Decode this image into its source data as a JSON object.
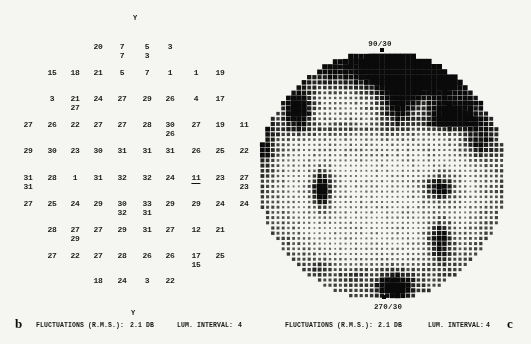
{
  "colors": {
    "paper": "#f5f5f1",
    "ink": "#1a1a1a",
    "dot": "#0a0a0a"
  },
  "panel_b": {
    "label": "b",
    "y_axis_top": "Y",
    "y_axis_bottom": "Y",
    "caption": {
      "fluctuations_label": "FLUCTUATIONS (R.M.S.):",
      "fluctuations_value": "2.1 DB",
      "lum_label": "LUM. INTERVAL:",
      "lum_value": "4"
    }
  },
  "panel_c": {
    "label": "c",
    "meridian_top": "90/30",
    "meridian_bottom": "270/30",
    "caption": {
      "fluctuations_label": "FLUCTUATIONS (R.M.S.):",
      "fluctuations_value": "2.1 DB",
      "lum_label": "LUM. INTERVAL:",
      "lum_value": "4"
    }
  },
  "chart_data": [
    {
      "type": "heatmap",
      "title": "Differential light sensitivity values grid (dB) - panel b",
      "value_unit": "dB",
      "layout": {
        "col_x": [
          28,
          52,
          75,
          98,
          122,
          147,
          170,
          196,
          220,
          244
        ],
        "row_y": [
          47,
          73,
          99,
          125,
          151,
          178,
          204,
          230,
          256,
          281
        ],
        "second_value_offset": 9
      },
      "points": [
        [
          0,
          3,
          "20",
          null,
          0
        ],
        [
          0,
          4,
          "7",
          "7",
          0
        ],
        [
          0,
          5,
          "5",
          "3",
          0
        ],
        [
          0,
          6,
          "3",
          null,
          0
        ],
        [
          1,
          1,
          "15",
          null,
          0
        ],
        [
          1,
          2,
          "18",
          null,
          0
        ],
        [
          1,
          3,
          "21",
          null,
          0
        ],
        [
          1,
          4,
          "5",
          null,
          0
        ],
        [
          1,
          5,
          "7",
          null,
          0
        ],
        [
          1,
          6,
          "1",
          null,
          0
        ],
        [
          1,
          7,
          "1",
          null,
          0
        ],
        [
          1,
          8,
          "19",
          null,
          0
        ],
        [
          2,
          1,
          "3",
          null,
          0
        ],
        [
          2,
          2,
          "21",
          "27",
          0
        ],
        [
          2,
          3,
          "24",
          null,
          0
        ],
        [
          2,
          4,
          "27",
          null,
          0
        ],
        [
          2,
          5,
          "29",
          null,
          0
        ],
        [
          2,
          6,
          "26",
          null,
          0
        ],
        [
          2,
          7,
          "4",
          null,
          0
        ],
        [
          2,
          8,
          "17",
          null,
          0
        ],
        [
          3,
          0,
          "27",
          null,
          0
        ],
        [
          3,
          1,
          "26",
          null,
          0
        ],
        [
          3,
          2,
          "22",
          null,
          0
        ],
        [
          3,
          3,
          "27",
          null,
          0
        ],
        [
          3,
          4,
          "27",
          null,
          0
        ],
        [
          3,
          5,
          "28",
          null,
          0
        ],
        [
          3,
          6,
          "30",
          "26",
          0
        ],
        [
          3,
          7,
          "27",
          null,
          0
        ],
        [
          3,
          8,
          "19",
          null,
          0
        ],
        [
          3,
          9,
          "11",
          null,
          0
        ],
        [
          4,
          0,
          "29",
          null,
          0
        ],
        [
          4,
          1,
          "30",
          null,
          0
        ],
        [
          4,
          2,
          "23",
          null,
          0
        ],
        [
          4,
          3,
          "30",
          null,
          0
        ],
        [
          4,
          4,
          "31",
          null,
          0
        ],
        [
          4,
          5,
          "31",
          null,
          0
        ],
        [
          4,
          6,
          "31",
          null,
          0
        ],
        [
          4,
          7,
          "26",
          null,
          0
        ],
        [
          4,
          8,
          "25",
          null,
          0
        ],
        [
          4,
          9,
          "22",
          null,
          0
        ],
        [
          5,
          0,
          "31",
          "31",
          0
        ],
        [
          5,
          1,
          "28",
          null,
          0
        ],
        [
          5,
          2,
          "1",
          null,
          0
        ],
        [
          5,
          3,
          "31",
          null,
          0
        ],
        [
          5,
          4,
          "32",
          null,
          0
        ],
        [
          5,
          5,
          "32",
          null,
          0
        ],
        [
          5,
          6,
          "24",
          null,
          0
        ],
        [
          5,
          7,
          "11",
          null,
          1
        ],
        [
          5,
          8,
          "23",
          null,
          0
        ],
        [
          5,
          9,
          "27",
          "23",
          0
        ],
        [
          6,
          0,
          "27",
          null,
          0
        ],
        [
          6,
          1,
          "25",
          null,
          0
        ],
        [
          6,
          2,
          "24",
          null,
          0
        ],
        [
          6,
          3,
          "29",
          null,
          0
        ],
        [
          6,
          4,
          "30",
          "32",
          0
        ],
        [
          6,
          5,
          "33",
          "31",
          0
        ],
        [
          6,
          6,
          "29",
          null,
          0
        ],
        [
          6,
          7,
          "29",
          null,
          0
        ],
        [
          6,
          8,
          "24",
          null,
          0
        ],
        [
          6,
          9,
          "24",
          null,
          0
        ],
        [
          7,
          1,
          "28",
          null,
          0
        ],
        [
          7,
          2,
          "27",
          "29",
          0
        ],
        [
          7,
          3,
          "27",
          null,
          0
        ],
        [
          7,
          4,
          "29",
          null,
          0
        ],
        [
          7,
          5,
          "31",
          null,
          0
        ],
        [
          7,
          6,
          "27",
          null,
          0
        ],
        [
          7,
          7,
          "12",
          null,
          0
        ],
        [
          7,
          8,
          "21",
          null,
          0
        ],
        [
          8,
          1,
          "27",
          null,
          0
        ],
        [
          8,
          2,
          "22",
          null,
          0
        ],
        [
          8,
          3,
          "27",
          null,
          0
        ],
        [
          8,
          4,
          "28",
          null,
          0
        ],
        [
          8,
          5,
          "26",
          null,
          0
        ],
        [
          8,
          6,
          "26",
          null,
          0
        ],
        [
          8,
          7,
          "17",
          "15",
          0
        ],
        [
          8,
          8,
          "25",
          null,
          0
        ],
        [
          9,
          3,
          "18",
          null,
          0
        ],
        [
          9,
          4,
          "24",
          null,
          0
        ],
        [
          9,
          5,
          "3",
          null,
          0
        ],
        [
          9,
          6,
          "22",
          null,
          0
        ]
      ],
      "notes": "second value = repeat determination; underlined 11 = flagged defect point"
    },
    {
      "type": "heatmap",
      "title": "Gray-scale dot-density map of visual field - panel c",
      "meridian_top": "90/30",
      "meridian_bottom": "270/30",
      "layout": {
        "cx": 382,
        "cy": 176,
        "r": 124,
        "spacing": 5.2,
        "base": 0.22,
        "ring_start": 0.72,
        "ring_amp": 0.33,
        "noise_amp": 0.16,
        "dot_min": 1.1,
        "dot_gain": 3.9
      },
      "dark_regions": [
        [
          415,
          76,
          33,
          17,
          1.1
        ],
        [
          376,
          68,
          68,
          14,
          0.5
        ],
        [
          398,
          108,
          13,
          14,
          0.65
        ],
        [
          445,
          123,
          28,
          5,
          0.35
        ],
        [
          299,
          110,
          9,
          12,
          0.95
        ],
        [
          330,
          129,
          45,
          5,
          0.3
        ],
        [
          446,
          113,
          13,
          11,
          0.8
        ],
        [
          470,
          115,
          12,
          14,
          0.4
        ],
        [
          478,
          144,
          11,
          11,
          0.5
        ],
        [
          322,
          189,
          7,
          13,
          1.0
        ],
        [
          440,
          188,
          11,
          9,
          0.8
        ],
        [
          440,
          240,
          9,
          14,
          0.8
        ],
        [
          394,
          286,
          13,
          8,
          1.05
        ],
        [
          395,
          268,
          35,
          7,
          0.22
        ],
        [
          352,
          277,
          10,
          5,
          0.3
        ],
        [
          322,
          268,
          8,
          6,
          0.3
        ],
        [
          264,
          150,
          8,
          18,
          0.35
        ]
      ],
      "markers": [
        [
          382,
          50
        ],
        [
          384,
          297
        ]
      ]
    }
  ]
}
